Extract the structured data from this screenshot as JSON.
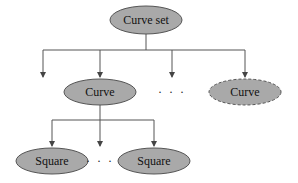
{
  "colors": {
    "node_fill": "#a9a9a9",
    "node_stroke": "#555555",
    "edge": "#555555",
    "background": "#ffffff"
  },
  "root": {
    "label": "Curve set"
  },
  "level1": {
    "nodes": [
      {
        "label": "Curve",
        "style": "solid"
      },
      {
        "label": "Curve",
        "style": "dashed"
      }
    ],
    "ellipsis": "· · ·"
  },
  "level2": {
    "nodes": [
      {
        "label": "Square",
        "style": "solid"
      },
      {
        "label": "Square",
        "style": "solid"
      }
    ],
    "ellipsis": "· · ·"
  }
}
